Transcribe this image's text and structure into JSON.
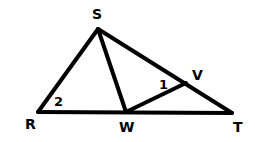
{
  "diagram": {
    "type": "geometry-triangle",
    "points": {
      "R": {
        "label": "R",
        "x": 38,
        "y": 112,
        "lx": 25,
        "ly": 129
      },
      "S": {
        "label": "S",
        "x": 98,
        "y": 29,
        "lx": 92,
        "ly": 19
      },
      "W": {
        "label": "W",
        "x": 126,
        "y": 112,
        "lx": 119,
        "ly": 132
      },
      "T": {
        "label": "T",
        "x": 232,
        "y": 113,
        "lx": 233,
        "ly": 132
      },
      "V": {
        "label": "V",
        "x": 186,
        "y": 83,
        "lx": 192,
        "ly": 80
      }
    },
    "segments": [
      {
        "name": "RS",
        "from": "R",
        "to": "S"
      },
      {
        "name": "ST",
        "from": "S",
        "to": "T"
      },
      {
        "name": "RT",
        "from": "R",
        "to": "T"
      },
      {
        "name": "SW",
        "from": "S",
        "to": "W"
      },
      {
        "name": "WV",
        "from": "W",
        "to": "V"
      }
    ],
    "angle_labels": [
      {
        "label": "1",
        "x": 159,
        "y": 89
      },
      {
        "label": "2",
        "x": 54,
        "y": 106
      }
    ],
    "stroke_color": "#000000",
    "background": "#ffffff"
  }
}
